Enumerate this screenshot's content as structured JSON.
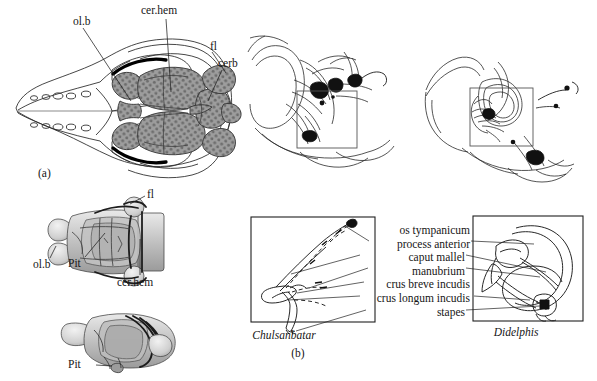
{
  "figure": {
    "type": "anatomical-illustration",
    "panels": [
      {
        "id": "a",
        "caption": "(a)",
        "description": "Dorsal view of skull with brain endocast and two endocast views"
      },
      {
        "id": "b",
        "caption": "(b)",
        "description": "Comparison of auditory ossicles"
      }
    ]
  },
  "panel_a": {
    "caption": "(a)",
    "skull_labels": [
      {
        "key": "ol_b",
        "text": "ol.b"
      },
      {
        "key": "cer_hem",
        "text": "cer.hem"
      },
      {
        "key": "fl",
        "text": "fl"
      },
      {
        "key": "cerb",
        "text": "cerb"
      }
    ],
    "endocast_dorsal_labels": [
      {
        "key": "fl",
        "text": "fl"
      },
      {
        "key": "ol_b",
        "text": "ol.b"
      },
      {
        "key": "pit",
        "text": "Pit"
      },
      {
        "key": "cer_hem",
        "text": "cer.hem"
      }
    ],
    "endocast_lateral_labels": [
      {
        "key": "pit",
        "text": "Pit"
      }
    ]
  },
  "panel_b": {
    "caption": "(b)",
    "left_taxon": "Chulsanbatar",
    "right_taxon": "Didelphis",
    "ossicle_labels": [
      {
        "key": "os_tympanicum",
        "text": "os tympanicum"
      },
      {
        "key": "process_anterior",
        "text": "process anterior"
      },
      {
        "key": "caput_mallel",
        "text": "caput mallel"
      },
      {
        "key": "manubrium",
        "text": "manubrium"
      },
      {
        "key": "crus_breve_incudis",
        "text": "crus breve incudis"
      },
      {
        "key": "crus_longum_incudis",
        "text": "crus longum incudis"
      },
      {
        "key": "stapes",
        "text": "stapes"
      }
    ]
  },
  "colors": {
    "ink": "#1a1a1a",
    "line": "#2b2b2b",
    "endocast_fill": "#9a9a9a",
    "endocast_stipple": "#6a6a6a",
    "background": "#ffffff"
  }
}
